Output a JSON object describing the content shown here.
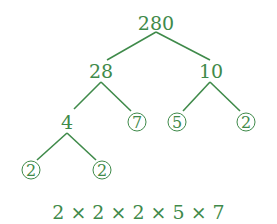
{
  "diagram": {
    "type": "factor-tree",
    "color": "#3f8a4a",
    "nodes": {
      "root": "280",
      "left": "28",
      "right": "10",
      "left_left": "4",
      "left_right": "7",
      "right_left": "5",
      "right_right": "2",
      "ll_left": "2",
      "ll_right": "2"
    },
    "prime_nodes": [
      "7",
      "5",
      "2",
      "2",
      "2"
    ],
    "result": "2 × 2 × 2 × 5 × 7"
  }
}
